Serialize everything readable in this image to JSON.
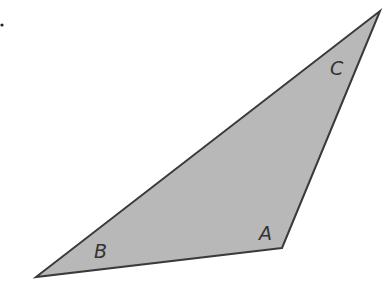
{
  "diagram": {
    "type": "triangle",
    "fill_color": "#b8b8b8",
    "stroke_color": "#3a3a3a",
    "stroke_width": 2,
    "vertices": [
      {
        "name": "A",
        "x": 282,
        "y": 248
      },
      {
        "name": "B",
        "x": 36,
        "y": 277
      },
      {
        "name": "C",
        "x": 380,
        "y": 11
      }
    ],
    "labels": [
      {
        "text": "A",
        "x": 259,
        "y": 240
      },
      {
        "text": "B",
        "x": 94,
        "y": 258
      },
      {
        "text": "C",
        "x": 330,
        "y": 75
      }
    ],
    "marker_dot": {
      "x": 2,
      "y": 25
    }
  }
}
